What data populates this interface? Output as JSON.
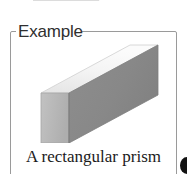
{
  "page": {
    "width": 187,
    "height": 174,
    "background": "#ffffff"
  },
  "callout": {
    "legend_label": "Example",
    "border_color": "#9a9a9a",
    "legend_color": "#2f2f2f"
  },
  "figure": {
    "name": "rectangular-prism",
    "caption": "A rectangular prism",
    "caption_color": "#1b1b1b",
    "faces": {
      "top_label": "top face",
      "top_color": "#f0f0f0",
      "front_label": "front face",
      "front_color": "#b8b8b8",
      "right_label": "right face",
      "right_color": "#8a8a8a"
    },
    "edge_color": "#7d7d7d"
  },
  "top_cutoff": {
    "label": "partial figure above",
    "color": "#b5b5b5"
  },
  "corner_glyph": {
    "label": "clipped dark glyph",
    "color": "#121212"
  }
}
